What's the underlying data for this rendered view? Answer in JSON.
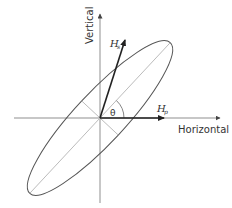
{
  "diagram": {
    "type": "polarization-ellipse",
    "colors": {
      "axis": "#9a9a9a",
      "ellipse": "#555555",
      "arrow": "#222222",
      "text": "#333333",
      "background": "#ffffff"
    },
    "axes": {
      "vertical_label": "Vertical",
      "horizontal_label": "Horizontal"
    },
    "vectors": [
      {
        "name": "H",
        "subscript": "s"
      },
      {
        "name": "H",
        "subscript": "p"
      }
    ],
    "angle_label": "θ"
  }
}
